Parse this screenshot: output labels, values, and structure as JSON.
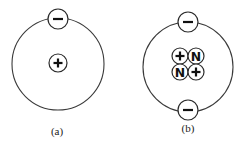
{
  "diagram": {
    "panels": [
      {
        "id": "a",
        "caption": "(a)",
        "orbit": {
          "cx": 58,
          "cy": 64,
          "r": 46
        },
        "electrons": [
          {
            "symbol": "−",
            "cx": 58,
            "cy": 19,
            "r": 10
          }
        ],
        "nucleus": [
          {
            "symbol": "+",
            "kind": "proton",
            "cx": 58,
            "cy": 63,
            "r": 9
          }
        ],
        "caption_pos": {
          "x": 57,
          "y": 131
        }
      },
      {
        "id": "b",
        "caption": "(b)",
        "orbit": {
          "cx": 188,
          "cy": 67,
          "r": 45
        },
        "electrons": [
          {
            "symbol": "−",
            "cx": 188,
            "cy": 22,
            "r": 10
          },
          {
            "symbol": "−",
            "cx": 188,
            "cy": 110,
            "r": 10
          }
        ],
        "nucleus": [
          {
            "symbol": "+",
            "kind": "proton",
            "cx": 180,
            "cy": 56,
            "r": 8
          },
          {
            "symbol": "N",
            "kind": "neutron",
            "cx": 196,
            "cy": 56,
            "r": 8
          },
          {
            "symbol": "N",
            "kind": "neutron",
            "cx": 180,
            "cy": 72,
            "r": 8
          },
          {
            "symbol": "+",
            "kind": "proton",
            "cx": 196,
            "cy": 72,
            "r": 8
          }
        ],
        "caption_pos": {
          "x": 188,
          "y": 128
        }
      }
    ]
  }
}
